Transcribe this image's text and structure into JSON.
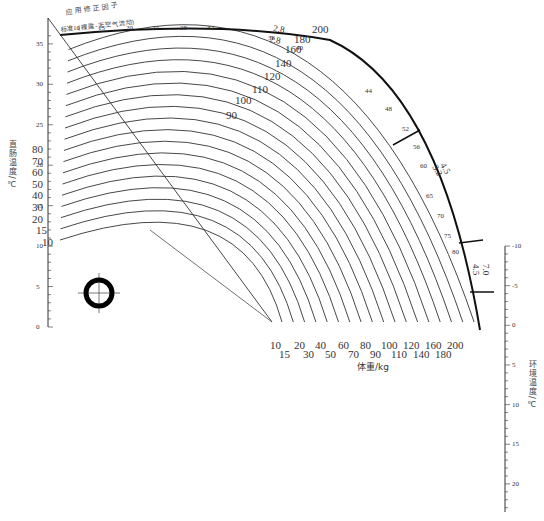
{
  "figure": {
    "title_top": "应 用 修 正 因 子",
    "subtitle_top": "标准（裸露-无空气流动）",
    "left_axis_label": "直肠温度/℃",
    "right_axis_label": "环境温度/℃",
    "bottom_axis_label": "体重/kg",
    "left_axis_ticks": [
      "35",
      "30",
      "25",
      "20",
      "15",
      "10",
      "5",
      "0"
    ],
    "right_axis_ticks": [
      "-10",
      "-5",
      "0",
      "5",
      "10",
      "15",
      "20"
    ],
    "weight_labels_row1": [
      "10",
      "20",
      "40",
      "60",
      "80",
      "100",
      "120",
      "160",
      "200"
    ],
    "weight_labels_row2": [
      "15",
      "30",
      "50",
      "70",
      "90",
      "110",
      "140",
      "180"
    ],
    "left_curve_labels": [
      "80",
      "70",
      "60",
      "50",
      "40",
      "30",
      "20",
      "15",
      "10"
    ],
    "arc_weight_labels": [
      "90",
      "100",
      "110",
      "120",
      "140",
      "160",
      "180",
      "200"
    ],
    "correction_factors": [
      "2.8",
      "2.8",
      "4.5",
      "3.2",
      "7.0",
      "4.5"
    ],
    "outer_arc_ticks": [
      "44",
      "48",
      "52",
      "56",
      "60",
      "65",
      "70",
      "75",
      "80"
    ],
    "top_arc_ticks": [
      "10",
      "15",
      "20",
      "24",
      "28",
      "32",
      "36",
      "40"
    ]
  }
}
